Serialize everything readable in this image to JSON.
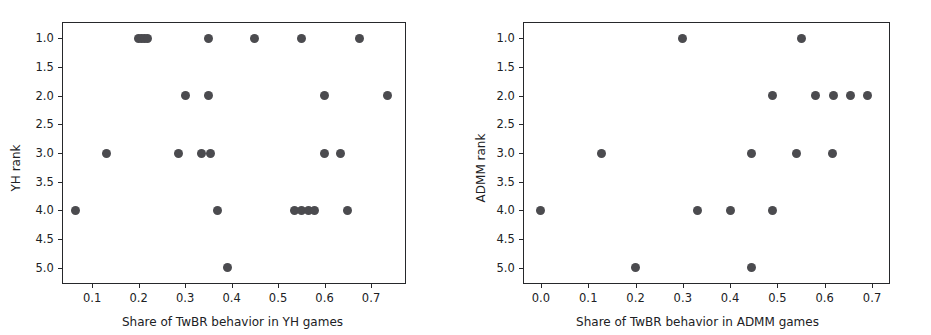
{
  "figure": {
    "background": "#ffffff",
    "marker_color": "#4b4b4f",
    "axis_color": "#26282b"
  },
  "chart_data": [
    {
      "type": "scatter",
      "panel_id": "left",
      "title": "",
      "xlabel": "Share of TwBR behavior in YH games",
      "ylabel": "YH rank",
      "xlim": [
        0.035,
        0.775
      ],
      "ylim": [
        0.72,
        5.28
      ],
      "y_inverted": true,
      "grid": false,
      "legend": "none",
      "xticks": [
        0.1,
        0.2,
        0.3,
        0.4,
        0.5,
        0.6,
        0.7
      ],
      "xticklabels": [
        "0.1",
        "0.2",
        "0.3",
        "0.4",
        "0.5",
        "0.6",
        "0.7"
      ],
      "yticks": [
        1.0,
        1.5,
        2.0,
        2.5,
        3.0,
        3.5,
        4.0,
        4.5,
        5.0
      ],
      "yticklabels": [
        "1.0",
        "1.5",
        "2.0",
        "2.5",
        "3.0",
        "3.5",
        "4.0",
        "4.5",
        "5.0"
      ],
      "x": [
        0.2,
        0.206,
        0.212,
        0.218,
        0.35,
        0.45,
        0.55,
        0.675,
        0.3,
        0.35,
        0.6,
        0.735,
        0.13,
        0.285,
        0.335,
        0.355,
        0.6,
        0.635,
        0.065,
        0.37,
        0.535,
        0.55,
        0.565,
        0.578,
        0.65,
        0.39
      ],
      "y": [
        1,
        1,
        1,
        1,
        1,
        1,
        1,
        1,
        2,
        2,
        2,
        2,
        3,
        3,
        3,
        3,
        3,
        3,
        4,
        4,
        4,
        4,
        4,
        4,
        4,
        5
      ],
      "n_points": 26
    },
    {
      "type": "scatter",
      "panel_id": "right",
      "title": "",
      "xlabel": "Share of TwBR behavior in ADMM games",
      "ylabel": "ADMM rank",
      "xlim": [
        -0.038,
        0.738
      ],
      "ylim": [
        0.72,
        5.28
      ],
      "y_inverted": true,
      "grid": false,
      "legend": "none",
      "xticks": [
        0.0,
        0.1,
        0.2,
        0.3,
        0.4,
        0.5,
        0.6,
        0.7
      ],
      "xticklabels": [
        "0.0",
        "0.1",
        "0.2",
        "0.3",
        "0.4",
        "0.5",
        "0.6",
        "0.7"
      ],
      "yticks": [
        1.0,
        1.5,
        2.0,
        2.5,
        3.0,
        3.5,
        4.0,
        4.5,
        5.0
      ],
      "yticklabels": [
        "1.0",
        "1.5",
        "2.0",
        "2.5",
        "3.0",
        "3.5",
        "4.0",
        "4.5",
        "5.0"
      ],
      "x": [
        0.3,
        0.55,
        0.49,
        0.58,
        0.618,
        0.655,
        0.69,
        0.127,
        0.445,
        0.54,
        0.617,
        0.0,
        0.33,
        0.4,
        0.49,
        0.2,
        0.445
      ],
      "y": [
        1,
        1,
        2,
        2,
        2,
        2,
        2,
        3,
        3,
        3,
        3,
        4,
        4,
        4,
        4,
        5,
        5
      ],
      "n_points": 17
    }
  ]
}
